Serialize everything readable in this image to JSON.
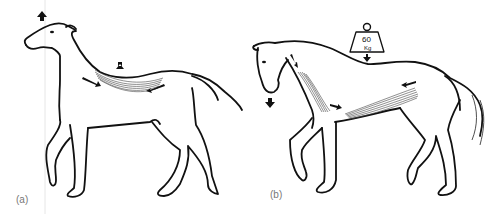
{
  "figure": {
    "panels": [
      {
        "label": "(a)",
        "description": "Horse with raised head; back muscles contracted, back hollowed",
        "arrows": [
          "head-up-arrow",
          "back-down-arrow",
          "back-muscle-arrow-left",
          "back-muscle-arrow-right"
        ]
      },
      {
        "label": "(b)",
        "description": "Horse with lowered head carrying weight; back lifted by neck and abdominal muscles",
        "weight_label": "60",
        "weight_unit": "Kg",
        "arrows": [
          "head-down-arrow",
          "weight-down-arrow",
          "neck-muscle-arrow",
          "abdominal-arrow-left",
          "abdominal-arrow-right"
        ]
      }
    ]
  }
}
